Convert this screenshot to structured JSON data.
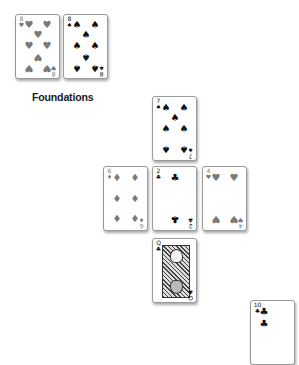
{
  "foundations": {
    "label": "Foundations",
    "cards": [
      {
        "rank": "8",
        "suit": "hearts",
        "suit_glyph": "♥",
        "color": "#7a7a7a"
      },
      {
        "rank": "8",
        "suit": "spades",
        "suit_glyph": "♠",
        "color": "#111111"
      }
    ]
  },
  "tableau": {
    "top": {
      "rank": "7",
      "suit": "spades",
      "suit_glyph": "♠"
    },
    "row": [
      {
        "rank": "6",
        "suit": "diamonds",
        "suit_glyph": "♦"
      },
      {
        "rank": "2",
        "suit": "clubs",
        "suit_glyph": "♣"
      },
      {
        "rank": "4",
        "suit": "hearts",
        "suit_glyph": "♥"
      }
    ],
    "bottom": {
      "rank": "Q",
      "suit": "clubs",
      "suit_glyph": "♣"
    }
  },
  "partial_card": {
    "rank": "10",
    "suit": "clubs",
    "suit_glyph": "♣"
  }
}
